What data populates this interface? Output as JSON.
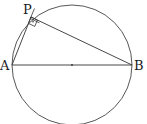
{
  "diagram": {
    "type": "geometry",
    "points": {
      "A": {
        "label": "A",
        "x": 12,
        "y": 65
      },
      "B": {
        "label": "B",
        "x": 132,
        "y": 65
      },
      "P": {
        "label": "P",
        "x": 31,
        "y": 17
      },
      "center": {
        "x": 72,
        "y": 65
      }
    },
    "circle": {
      "cx": 72,
      "cy": 65,
      "r": 60
    },
    "right_angle_marker": {
      "at": "P",
      "has_dot": true
    },
    "colors": {
      "stroke": "#333333",
      "background": "#ffffff"
    }
  }
}
